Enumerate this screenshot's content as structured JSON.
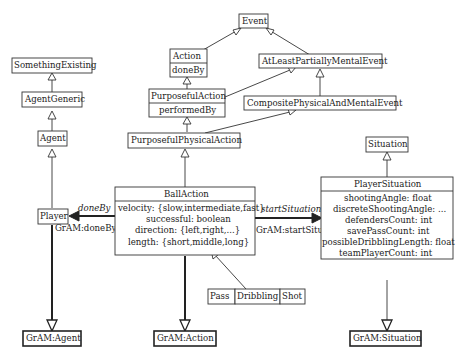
{
  "diagram": {
    "classes": {
      "event": "Event",
      "action": "Action",
      "action_attr": "doneBy",
      "at_least_partially_mental_event": "AtLeastPartiallyMentalEvent",
      "purposeful_action": "PurposefulAction",
      "purposeful_action_attr": "performedBy",
      "composite_physical_and_mental_event": "CompositePhysicalAndMentalEvent",
      "purposeful_physical_action": "PurposefulPhysicalAction",
      "something_existing": "SomethingExisting",
      "agent_generic": "AgentGeneric",
      "agent": "Agent",
      "player": "Player",
      "situation": "Situation",
      "ball_action": {
        "name": "BallAction",
        "attributes": [
          "velocity: {slow,intermediate,fast}",
          "successful: boolean",
          "direction: {left,right,...}",
          "length: {short,middle,long}"
        ]
      },
      "player_situation": {
        "name": "PlayerSituation",
        "attributes": [
          "shootingAngle: float",
          "discreteShootingAngle: ...",
          "defendersCount: int",
          "savePassCount: int",
          "possibleDribblingLength: float",
          "teamPlayerCount: int"
        ]
      },
      "subtypes": [
        "Pass",
        "Dribbling",
        "Shot"
      ],
      "gram_agent": "GrAM:Agent",
      "gram_action": "GrAM:Action",
      "gram_situation": "GrAM:Situation"
    },
    "associations": {
      "done_by_label": "doneBy",
      "done_by_mapping": "GrAM:doneBy",
      "start_situation_label": "startSituation",
      "start_situation_mapping": "GrAM:startSituation"
    }
  }
}
